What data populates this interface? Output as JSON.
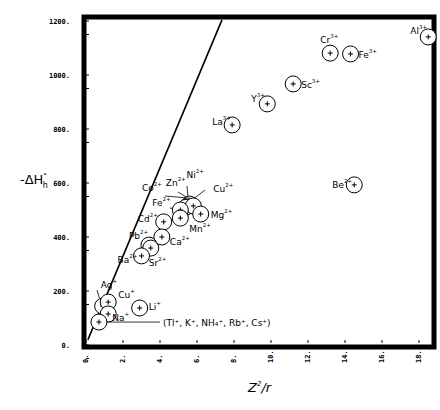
{
  "chart_data": {
    "type": "scatter",
    "title": "",
    "xlabel": "Z²/r",
    "ylabel": "-ΔH°h",
    "xlim": [
      0,
      19
    ],
    "ylim": [
      0,
      1200
    ],
    "x_ticks": [
      0,
      2,
      4,
      6,
      8,
      10,
      12,
      14,
      16,
      18
    ],
    "y_ticks": [
      0,
      200,
      400,
      600,
      800,
      1000,
      1200
    ],
    "y_tick_labels": [
      "0.",
      "200.",
      "400.",
      "600.",
      "800.",
      "1000.",
      "1200."
    ],
    "grid": false,
    "legend": null,
    "series": [
      {
        "name": "ions",
        "points": [
          {
            "label": "Al",
            "charge": "3+",
            "x": 18.5,
            "y": 1141
          },
          {
            "label": "Cr",
            "charge": "3+",
            "x": 13.2,
            "y": 1081
          },
          {
            "label": "Fe",
            "charge": "3+",
            "x": 14.3,
            "y": 1078
          },
          {
            "label": "Sc",
            "charge": "3+",
            "x": 11.2,
            "y": 967
          },
          {
            "label": "Y",
            "charge": "3+",
            "x": 9.8,
            "y": 893
          },
          {
            "label": "La",
            "charge": "3+",
            "x": 7.9,
            "y": 815
          },
          {
            "label": "Be",
            "charge": "2+",
            "x": 14.5,
            "y": 593
          },
          {
            "label": "Ni",
            "charge": "2+",
            "x": 5.6,
            "y": 522
          },
          {
            "label": "Zn",
            "charge": "2+",
            "x": 5.5,
            "y": 515
          },
          {
            "label": "Co",
            "charge": "2+",
            "x": 5.4,
            "y": 510
          },
          {
            "label": "Cu",
            "charge": "2+",
            "x": 5.8,
            "y": 515
          },
          {
            "label": "Fe",
            "charge": "2+",
            "x": 5.1,
            "y": 500
          },
          {
            "label": "Mg",
            "charge": "2+",
            "x": 6.2,
            "y": 485
          },
          {
            "label": "Mn",
            "charge": "2+",
            "x": 5.1,
            "y": 470
          },
          {
            "label": "Cd",
            "charge": "2+",
            "x": 4.2,
            "y": 456
          },
          {
            "label": "Ca",
            "charge": "2+",
            "x": 4.1,
            "y": 400
          },
          {
            "label": "Pb",
            "charge": "2+",
            "x": 3.4,
            "y": 370
          },
          {
            "label": "Sr",
            "charge": "2+",
            "x": 3.5,
            "y": 359
          },
          {
            "label": "Ba",
            "charge": "2+",
            "x": 3.0,
            "y": 330
          },
          {
            "label": "Ag",
            "charge": "+",
            "x": 0.9,
            "y": 144
          },
          {
            "label": "Cu",
            "charge": "+",
            "x": 1.2,
            "y": 159
          },
          {
            "label": "Na",
            "charge": "+",
            "x": 1.2,
            "y": 115
          },
          {
            "label": "Li",
            "charge": "+",
            "x": 2.9,
            "y": 137
          },
          {
            "label": "(Tl+, K+, NH4+, Rb+, Cs+)",
            "charge": "+",
            "x": 0.7,
            "y": 85
          }
        ]
      }
    ],
    "reference_line": {
      "x1": 0.1,
      "y1": 19,
      "x2": 7.35,
      "y2": 1204
    },
    "annotations": [
      "(Tl⁺, K⁺, NH₄⁺, Rb⁺, Cs⁺)"
    ]
  },
  "labels": {
    "y_axis_title_main": "-ΔH",
    "y_axis_title_sup": "°",
    "y_axis_title_sub": "h",
    "x_axis_title_main": "Z",
    "x_axis_title_sup": "2",
    "x_axis_title_rest": "/r",
    "group_label": "(Tl⁺, K⁺, NH₄⁺, Rb⁺, Cs⁺)"
  }
}
